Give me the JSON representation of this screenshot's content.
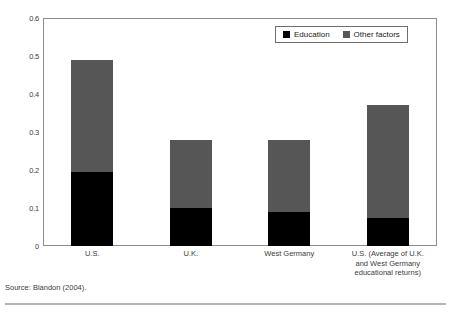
{
  "figure": {
    "title": "",
    "source_note": "Source: Blandon (2004)."
  },
  "legend": {
    "entries": [
      {
        "label": "Education",
        "color": "#000000",
        "icon": "square-swatch"
      },
      {
        "label": "Other factors",
        "color": "#565656",
        "icon": "square-swatch"
      }
    ]
  },
  "chart_data": {
    "type": "bar",
    "subtype": "stacked-column",
    "title": "",
    "xlabel": "",
    "ylabel": "",
    "ylim": [
      0,
      0.6
    ],
    "yticks": [
      "0",
      "0.1",
      "0.2",
      "0.3",
      "0.4",
      "0.5",
      "0.6"
    ],
    "ytick_values": [
      0,
      0.1,
      0.2,
      0.3,
      0.4,
      0.5,
      0.6
    ],
    "grid": false,
    "legend_position": "top-right",
    "categories": [
      "U.S.",
      "U.K.",
      "West Germany",
      "U.S. (Average of U.K. and West Germany educational returns)"
    ],
    "category_label_lines": [
      [
        "U.S."
      ],
      [
        "U.K."
      ],
      [
        "West Germany"
      ],
      [
        "U.S. (Average of U.K.",
        "and West Germany",
        "educational returns)"
      ]
    ],
    "series": [
      {
        "name": "Education",
        "color": "#000000",
        "values": [
          0.195,
          0.1,
          0.09,
          0.075
        ]
      },
      {
        "name": "Other factors",
        "color": "#565656",
        "values": [
          0.295,
          0.18,
          0.188,
          0.295
        ]
      }
    ],
    "totals": [
      0.49,
      0.28,
      0.278,
      0.37
    ]
  }
}
